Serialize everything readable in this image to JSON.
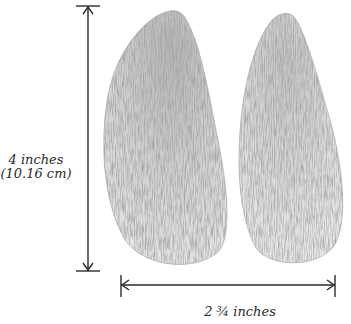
{
  "diagram": {
    "type": "dimensioned-illustration",
    "height_dimension": {
      "line1": "4 inches",
      "line2": "(10.16 cm)",
      "orientation": "vertical"
    },
    "width_dimension": {
      "label": "2 ¾ inches",
      "orientation": "horizontal"
    },
    "colors": {
      "ink": "#2a2a2a",
      "pencil_dark": "#5a5a5a",
      "pencil_light": "#c8c8c8",
      "background": "#ffffff"
    }
  }
}
